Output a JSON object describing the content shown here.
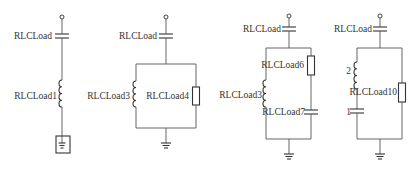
{
  "diagram": {
    "type": "circuit-schematic",
    "colors": {
      "wire": "#555555",
      "component": "#333333",
      "text": "#333333",
      "background": "#ffffff"
    },
    "circuits": [
      {
        "id": "circuit-1",
        "topology": "series",
        "labels": {
          "capacitor": "RLCLoad",
          "inductor": "RLCLoad1"
        },
        "components": [
          "terminal",
          "capacitor",
          "inductor",
          "boxed-ground"
        ]
      },
      {
        "id": "circuit-2",
        "topology": "series capacitor then parallel inductor || resistor",
        "labels": {
          "capacitor": "RLCLoad",
          "inductor": "RLCLoad3",
          "resistor": "RLCLoad4"
        },
        "components": [
          "terminal",
          "capacitor",
          "inductor",
          "resistor",
          "ground"
        ]
      },
      {
        "id": "circuit-3",
        "topology": "series capacitor then parallel inductor || (resistor + capacitor)",
        "labels": {
          "capacitor": "RLCLoad",
          "inductor": "RLCLoad3",
          "resistor": "RLCLoad6",
          "capacitor2": "RLCLoad7"
        },
        "components": [
          "terminal",
          "capacitor",
          "inductor",
          "resistor",
          "capacitor",
          "ground"
        ]
      },
      {
        "id": "circuit-4",
        "topology": "series capacitor then parallel (inductor + capacitor) || resistor",
        "labels": {
          "capacitor": "RLCLoad",
          "inductor": "2",
          "capacitor2": "1",
          "resistor": "RLCLoad10"
        },
        "components": [
          "terminal",
          "capacitor",
          "inductor",
          "capacitor",
          "resistor",
          "ground"
        ]
      }
    ]
  }
}
